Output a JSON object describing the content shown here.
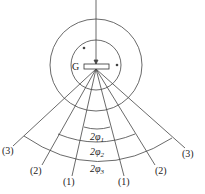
{
  "diagram": {
    "grating_label": "G",
    "orders": {
      "left": [
        "(3)",
        "(2)",
        "(1)"
      ],
      "right": [
        "(1)",
        "(2)",
        "(3)"
      ]
    },
    "angles": {
      "a1": "2φ",
      "a1_sub": "1",
      "a2": "2φ",
      "a2_sub": "2",
      "a3": "2φ",
      "a3_sub": "3"
    }
  }
}
